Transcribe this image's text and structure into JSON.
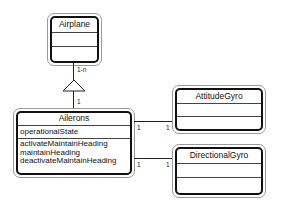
{
  "diagram": {
    "type": "UML class diagram",
    "classes": {
      "airplane": {
        "name": "Airplane",
        "attributes": [],
        "operations": []
      },
      "ailerons": {
        "name": "Ailerons",
        "attributes": [
          "operationalState"
        ],
        "operations": [
          "activateMaintainHeading",
          "maintainHeading",
          "deactivateMaintainHeading"
        ]
      },
      "attitude_gyro": {
        "name": "AttitudeGyro",
        "attributes": [],
        "operations": []
      },
      "directional_gyro": {
        "name": "DirectionalGyro",
        "attributes": [],
        "operations": []
      }
    },
    "relationships": {
      "airplane_ailerons": {
        "kind": "aggregation",
        "whole_multiplicity": "1-n",
        "part_multiplicity": "1"
      },
      "ailerons_attitude_gyro": {
        "source_multiplicity": "1",
        "target_multiplicity": "1"
      },
      "ailerons_directional_gyro": {
        "source_multiplicity": "1",
        "target_multiplicity": "1"
      }
    }
  }
}
